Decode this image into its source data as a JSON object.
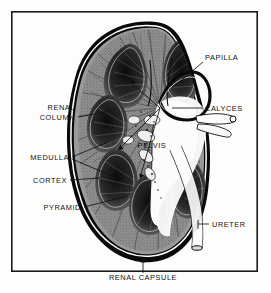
{
  "figure": {
    "background_color": "#fdfdfc",
    "ink_color": "#121212",
    "frame": {
      "x": 11,
      "y": 11,
      "width": 247,
      "height": 261,
      "stroke_color": "#1a1a1a"
    }
  },
  "labels": {
    "papilla": "PAPILLA",
    "calyces": "CALYCES",
    "renal_column_line1": "RENAL",
    "renal_column_line2": "COLUMN",
    "medulla": "MEDULLA",
    "cortex": "CORTEX",
    "pyramid": "PYRAMID",
    "pelvis": "PELVIS",
    "ureter": "URETER",
    "renal_capsule": "RENAL CAPSULE"
  }
}
